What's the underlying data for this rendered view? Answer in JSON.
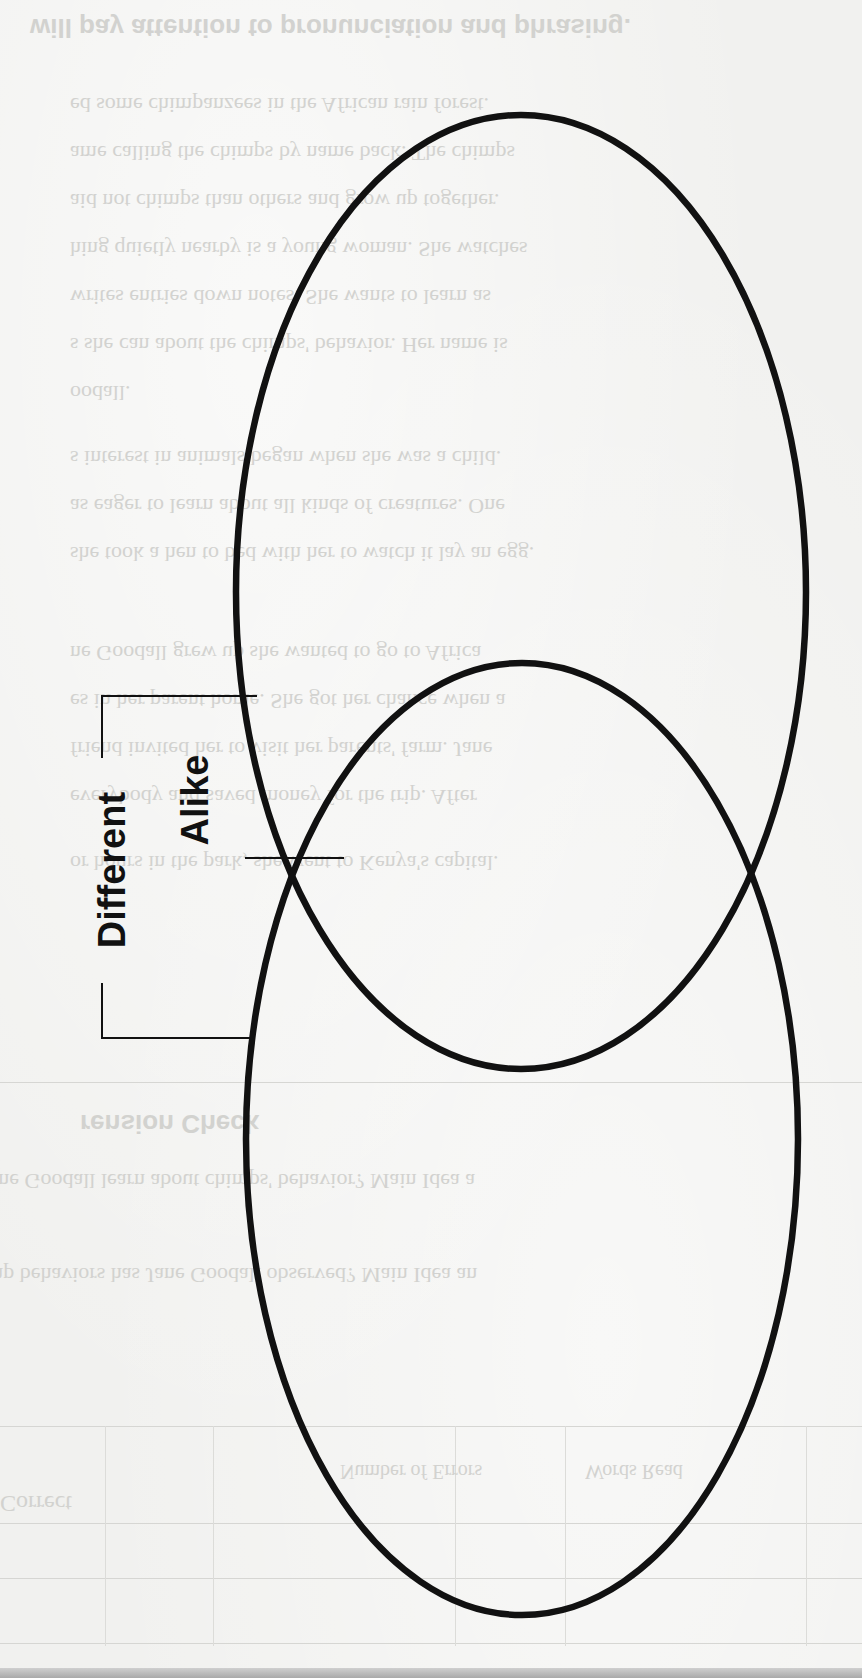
{
  "diagram": {
    "type": "venn",
    "orientation": "rotated-90",
    "labels": {
      "different": "Different",
      "alike": "Alike"
    },
    "stroke_color": "#111111",
    "paper_color": "#f1f1ef"
  },
  "bleed_through": {
    "lines": [
      "will pay attention to pronunciation and phrasing.",
      "ed some chimpanzees in the African rain forest.",
      "ame calling the chimps by name back. The chimps",
      "aid not chimps than others and grow up together.",
      "hing quietly nearby is a young woman. She watches",
      "writes entries down notes. She wants to learn as",
      "s she can about the chimps' behavior. Her name is",
      "oodall.",
      "s interest in animals began when she was a child.",
      "as eager to learn about all kinds of creatures. One",
      "she took a hen to bed with her to watch it lay an egg.",
      "ne Goodall grew up she wanted to go to Africa",
      "es in her parent home. She got her chance when a",
      "friend invited her to visit her parents' farm. Jane",
      "everybody and saved money for the trip. After",
      "or hours in the park, she went to Kenya's capital.",
      "rension Check",
      "Jane Goodall learn about chimps' behavior? Main Idea a",
      "imp behaviors has Jane Goodall observed? Main Idea an"
    ],
    "table_headers": [
      "Words Read",
      "Number of Errors",
      "Correct"
    ]
  }
}
